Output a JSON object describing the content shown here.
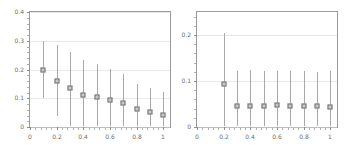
{
  "figure": {
    "background": "#ffffff",
    "marker_face_color": "#c9c9c9",
    "marker_edge_color": "#707070",
    "errorbar_color": "#a8a8a8",
    "frame_color": "#9a9a9a",
    "tick_label_color": "#6d6d6d"
  },
  "chart_data": [
    {
      "type": "scatter",
      "panel": "left",
      "title": "",
      "xlabel": "",
      "ylabel": "",
      "xlim": [
        0,
        1.05
      ],
      "ylim": [
        0,
        0.4
      ],
      "grid": true,
      "legend": "none",
      "xticks": [
        0,
        0.2,
        0.4,
        0.6,
        0.8,
        1
      ],
      "xticklabels": [
        "0",
        "0.2",
        "0.4",
        "0.6",
        "0.8",
        "1"
      ],
      "yticks": [
        0,
        0.1,
        0.2,
        0.3,
        0.4
      ],
      "yticklabels": [
        "0",
        "0.1",
        "0.2",
        "0.3",
        "0.4"
      ],
      "x": [
        0.1,
        0.2,
        0.3,
        0.4,
        0.5,
        0.6,
        0.7,
        0.8,
        0.9,
        1.0
      ],
      "y": [
        0.2,
        0.16,
        0.137,
        0.113,
        0.103,
        0.095,
        0.083,
        0.062,
        0.053,
        0.043
      ],
      "yerr_low": [
        0.1,
        0.04,
        0.002,
        0.002,
        0.002,
        0.002,
        0.002,
        0.002,
        0.002,
        0.002
      ],
      "yerr_high": [
        0.3,
        0.285,
        0.262,
        0.232,
        0.218,
        0.203,
        0.186,
        0.15,
        0.136,
        0.123
      ]
    },
    {
      "type": "scatter",
      "panel": "right",
      "title": "",
      "xlabel": "",
      "ylabel": "",
      "xlim": [
        0,
        1.05
      ],
      "ylim": [
        0,
        0.25
      ],
      "grid": true,
      "legend": "none",
      "xticks": [
        0,
        0.2,
        0.4,
        0.6,
        0.8,
        1
      ],
      "xticklabels": [
        "0",
        "0.2",
        "0.4",
        "0.6",
        "0.8",
        "1"
      ],
      "yticks": [
        0,
        0.1,
        0.2
      ],
      "yticklabels": [
        "0",
        "0.1",
        "0.2"
      ],
      "x": [
        0.2,
        0.3,
        0.4,
        0.5,
        0.6,
        0.7,
        0.8,
        0.9,
        1.0
      ],
      "y": [
        0.093,
        0.045,
        0.045,
        0.046,
        0.047,
        0.045,
        0.045,
        0.045,
        0.044
      ],
      "yerr_low": [
        0.002,
        0.002,
        0.002,
        0.002,
        0.002,
        0.002,
        0.002,
        0.002,
        0.002
      ],
      "yerr_high": [
        0.205,
        0.122,
        0.123,
        0.122,
        0.122,
        0.122,
        0.122,
        0.12,
        0.121
      ]
    }
  ]
}
